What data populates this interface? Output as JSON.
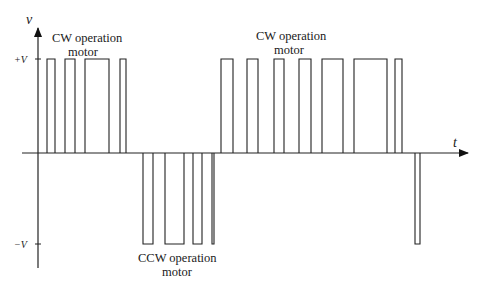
{
  "figure": {
    "y_axis_label": "v",
    "x_axis_label": "t",
    "plus_level_label": "+V",
    "minus_level_label": "−V",
    "annotations": [
      {
        "id": "cw1",
        "lines": [
          "CW operation",
          "motor"
        ]
      },
      {
        "id": "ccw",
        "lines": [
          "CCW operation",
          "motor"
        ]
      },
      {
        "id": "cw2",
        "lines": [
          "CW operation",
          "motor"
        ]
      }
    ]
  },
  "chart_data": {
    "type": "line",
    "title": "",
    "xlabel": "t",
    "ylabel": "v",
    "y_levels": {
      "+V": 1,
      "0": 0,
      "-V": -1
    },
    "pulses": [
      {
        "start": 9,
        "end": 17,
        "level": 1,
        "segment": "CW"
      },
      {
        "start": 27,
        "end": 37,
        "level": 1,
        "segment": "CW"
      },
      {
        "start": 47,
        "end": 71,
        "level": 1,
        "segment": "CW"
      },
      {
        "start": 82,
        "end": 88,
        "level": 1,
        "segment": "CW"
      },
      {
        "start": 105,
        "end": 115,
        "level": -1,
        "segment": "CCW"
      },
      {
        "start": 127,
        "end": 146,
        "level": -1,
        "segment": "CCW"
      },
      {
        "start": 155,
        "end": 164,
        "level": -1,
        "segment": "CCW"
      },
      {
        "start": 174,
        "end": 176,
        "level": -1,
        "segment": "CCW"
      },
      {
        "start": 183,
        "end": 195,
        "level": 1,
        "segment": "CW"
      },
      {
        "start": 209,
        "end": 220,
        "level": 1,
        "segment": "CW"
      },
      {
        "start": 236,
        "end": 246,
        "level": 1,
        "segment": "CW"
      },
      {
        "start": 261,
        "end": 273,
        "level": 1,
        "segment": "CW"
      },
      {
        "start": 284,
        "end": 305,
        "level": 1,
        "segment": "CW"
      },
      {
        "start": 316,
        "end": 349,
        "level": 1,
        "segment": "CW"
      },
      {
        "start": 357,
        "end": 364,
        "level": 1,
        "segment": "CW"
      },
      {
        "start": 377,
        "end": 382,
        "level": -1,
        "segment": "CW"
      }
    ],
    "x_range": [
      -16,
      427
    ],
    "ylim": [
      -1,
      1
    ]
  }
}
